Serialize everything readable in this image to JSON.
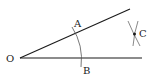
{
  "diagram": {
    "type": "angle-bisector-construction",
    "colors": {
      "line": "#1a1a1a",
      "arc": "#555555",
      "background": "#ffffff"
    },
    "points": {
      "O": {
        "label": "O",
        "x": 20,
        "y": 58
      },
      "A": {
        "label": "A",
        "x": 74,
        "y": 33
      },
      "B": {
        "label": "B",
        "x": 80,
        "y": 58
      },
      "C": {
        "label": "C",
        "x": 134,
        "y": 34
      }
    },
    "rays": [
      {
        "name": "upper-ray",
        "from": "O",
        "to": [
          130,
          9
        ]
      },
      {
        "name": "lower-ray",
        "from": "O",
        "to": [
          142,
          58
        ]
      }
    ],
    "arcs": [
      {
        "name": "arc-AB",
        "center": "O",
        "radius": 60
      },
      {
        "name": "arc-from-A",
        "near": "C"
      },
      {
        "name": "arc-from-B",
        "near": "C"
      }
    ]
  }
}
